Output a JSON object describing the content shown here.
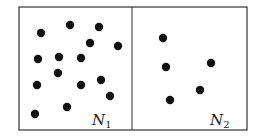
{
  "diagram": {
    "left_chamber": {
      "label": "N",
      "subscript": "1",
      "particle_count": 15,
      "particles": [
        [
          41,
          33
        ],
        [
          70,
          25
        ],
        [
          99,
          27
        ],
        [
          90,
          43
        ],
        [
          118,
          46
        ],
        [
          38,
          59
        ],
        [
          59,
          57
        ],
        [
          81,
          58
        ],
        [
          58,
          73
        ],
        [
          37,
          85
        ],
        [
          81,
          85
        ],
        [
          101,
          80
        ],
        [
          110,
          96
        ],
        [
          35,
          114
        ],
        [
          67,
          107
        ]
      ]
    },
    "right_chamber": {
      "label": "N",
      "subscript": "2",
      "particle_count": 5,
      "particles": [
        [
          163,
          38
        ],
        [
          166,
          67
        ],
        [
          211,
          63
        ],
        [
          200,
          90
        ],
        [
          170,
          100
        ]
      ]
    },
    "colors": {
      "stroke": "#333333",
      "particle": "#111111",
      "background": "#ffffff"
    }
  }
}
